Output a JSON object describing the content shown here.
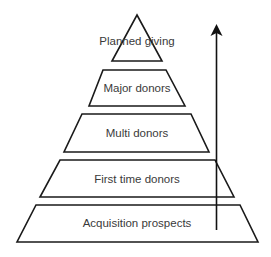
{
  "diagram": {
    "type": "pyramid",
    "colors": {
      "stroke": "#1a1a1a",
      "fill": "#ffffff",
      "text": "#3a3a3a",
      "arrow": "#111111"
    },
    "tiers": [
      {
        "label": "Planned giving"
      },
      {
        "label": "Major donors"
      },
      {
        "label": "Multi donors"
      },
      {
        "label": "First time donors"
      },
      {
        "label": "Acquisition prospects"
      }
    ],
    "arrow": {
      "direction": "up"
    }
  }
}
